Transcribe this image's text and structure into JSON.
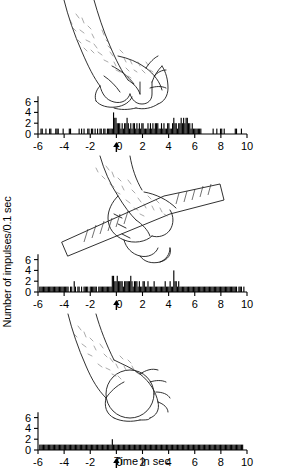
{
  "figure": {
    "axis_label_y": "Number of impulses/0.1 sec",
    "axis_label_x": "Time in sec",
    "stimulus_marker": "arrow-up-at-zero"
  },
  "panels": [
    {
      "id": "panel-power-grip",
      "illustration": "hand-power-grip-cylinder",
      "illustration_caption": "hand grasping with power grip"
    },
    {
      "id": "panel-precision-grip-bar",
      "illustration": "hand-holding-ruler-bar",
      "illustration_caption": "hand holding a graduated bar"
    },
    {
      "id": "panel-sphere-grasp",
      "illustration": "hand-grasping-sphere",
      "illustration_caption": "hand grasping a sphere"
    }
  ],
  "chart_data": {
    "type": "bar",
    "title": "",
    "xlabel": "Time in sec",
    "ylabel": "Number of impulses/0.1 sec",
    "xlim": [
      -6,
      10
    ],
    "ylim": [
      0,
      7
    ],
    "xticks": [
      -6,
      -4,
      -2,
      0,
      2,
      4,
      6,
      8,
      10
    ],
    "xticklabels": [
      "-6",
      "-4",
      "-2",
      "0",
      "2",
      "4",
      "6",
      "8",
      "10"
    ],
    "yticks": [
      0,
      2,
      4,
      6
    ],
    "yticklabels": [
      "0",
      "2",
      "4",
      "6"
    ],
    "bin_width": 0.1,
    "grid": false,
    "legend": "none",
    "annotations": [
      {
        "text": "arrow at t = 0",
        "x": 0,
        "type": "stimulus-onset-arrow"
      }
    ],
    "series": [
      {
        "name": "Power grip",
        "panel": "panel-power-grip",
        "x_start": -6,
        "values": [
          0,
          0,
          1,
          1,
          0,
          0,
          1,
          0,
          0,
          1,
          1,
          0,
          0,
          0,
          1,
          1,
          1,
          0,
          0,
          0,
          1,
          0,
          0,
          0,
          0,
          1,
          1,
          0,
          0,
          0,
          0,
          0,
          0,
          1,
          0,
          1,
          0,
          1,
          0,
          0,
          1,
          1,
          0,
          1,
          1,
          0,
          1,
          0,
          1,
          0,
          1,
          1,
          0,
          1,
          1,
          0,
          1,
          1,
          1,
          1,
          1,
          4,
          3,
          3,
          2,
          2,
          2,
          1,
          2,
          1,
          2,
          2,
          3,
          2,
          1,
          2,
          1,
          2,
          2,
          1,
          2,
          1,
          2,
          1,
          2,
          2,
          1,
          1,
          1,
          2,
          1,
          2,
          1,
          2,
          1,
          2,
          2,
          2,
          1,
          1,
          2,
          1,
          2,
          1,
          1,
          2,
          2,
          1,
          1,
          2,
          3,
          2,
          2,
          1,
          2,
          2,
          3,
          2,
          3,
          2,
          3,
          3,
          2,
          2,
          1,
          2,
          1,
          1,
          1,
          1,
          1,
          1,
          1,
          0,
          0,
          0,
          0,
          0,
          0,
          0,
          0,
          0,
          1,
          0,
          0,
          1,
          0,
          0,
          1,
          1,
          0,
          1,
          0,
          0,
          0,
          0,
          0,
          0,
          0,
          0,
          1,
          1,
          0,
          0,
          0,
          1,
          0,
          0,
          0,
          0
        ]
      },
      {
        "name": "Precision grip on bar",
        "panel": "panel-precision-grip-bar",
        "x_start": -6,
        "values": [
          0,
          1,
          1,
          1,
          1,
          1,
          1,
          1,
          1,
          1,
          1,
          1,
          1,
          1,
          1,
          1,
          1,
          1,
          1,
          1,
          1,
          1,
          1,
          1,
          1,
          0,
          1,
          1,
          0,
          2,
          1,
          0,
          1,
          1,
          0,
          1,
          0,
          1,
          1,
          1,
          1,
          0,
          1,
          1,
          1,
          1,
          1,
          1,
          0,
          1,
          1,
          1,
          1,
          1,
          1,
          1,
          1,
          1,
          1,
          1,
          3,
          3,
          2,
          2,
          3,
          2,
          2,
          2,
          2,
          1,
          2,
          2,
          2,
          2,
          2,
          3,
          2,
          1,
          2,
          2,
          2,
          1,
          2,
          1,
          1,
          2,
          2,
          1,
          1,
          2,
          1,
          1,
          1,
          1,
          2,
          1,
          1,
          1,
          1,
          1,
          1,
          1,
          1,
          2,
          1,
          1,
          1,
          2,
          1,
          1,
          4,
          2,
          2,
          1,
          2,
          1,
          1,
          1,
          1,
          1,
          1,
          1,
          1,
          1,
          1,
          1,
          1,
          1,
          1,
          1,
          1,
          1,
          1,
          1,
          1,
          1,
          1,
          1,
          1,
          1,
          1,
          1,
          1,
          1,
          1,
          1,
          1,
          1,
          1,
          1,
          1,
          1,
          1,
          1,
          1,
          1,
          1,
          1,
          1,
          1,
          1,
          1,
          0,
          1,
          1,
          1,
          0,
          1,
          0,
          0
        ]
      },
      {
        "name": "Sphere grasp",
        "panel": "panel-sphere-grasp",
        "x_start": -6,
        "values": [
          0,
          1,
          1,
          1,
          1,
          1,
          1,
          1,
          1,
          1,
          1,
          1,
          1,
          1,
          1,
          1,
          1,
          1,
          1,
          1,
          1,
          1,
          1,
          1,
          1,
          1,
          1,
          1,
          1,
          1,
          1,
          1,
          1,
          1,
          1,
          1,
          1,
          1,
          1,
          1,
          1,
          1,
          1,
          1,
          1,
          1,
          1,
          1,
          1,
          1,
          1,
          1,
          1,
          1,
          1,
          1,
          1,
          1,
          1,
          1,
          2,
          1,
          1,
          1,
          1,
          1,
          1,
          1,
          1,
          1,
          1,
          1,
          1,
          1,
          1,
          1,
          1,
          1,
          1,
          1,
          1,
          1,
          1,
          1,
          1,
          1,
          1,
          1,
          1,
          1,
          1,
          1,
          1,
          1,
          1,
          1,
          1,
          1,
          1,
          1,
          1,
          1,
          1,
          1,
          1,
          1,
          1,
          1,
          1,
          1,
          1,
          1,
          1,
          1,
          1,
          1,
          1,
          1,
          1,
          1,
          1,
          1,
          1,
          1,
          1,
          1,
          1,
          1,
          1,
          1,
          1,
          1,
          1,
          1,
          1,
          1,
          1,
          1,
          1,
          1,
          1,
          1,
          1,
          1,
          1,
          1,
          1,
          1,
          1,
          1,
          1,
          1,
          1,
          1,
          1,
          1,
          1,
          1,
          1,
          1,
          1,
          1,
          1,
          1,
          1,
          1,
          1,
          0,
          0,
          0
        ]
      }
    ]
  }
}
